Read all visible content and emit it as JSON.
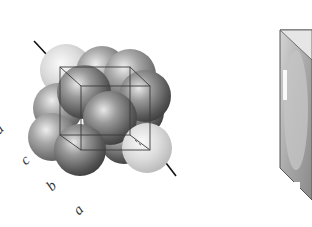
{
  "figure": {
    "axis_labels": {
      "a_left": "a",
      "c": "c",
      "b": "b",
      "a": "a"
    },
    "colors": {
      "background": "#ffffff",
      "sphere_dark": "#6e6e6e",
      "sphere_light": "#d8d8d8",
      "cube_edge": "#3a3a3a",
      "axis_line": "#111111",
      "prism_fill": "#b8b8b8",
      "prism_edge": "#555555"
    }
  }
}
